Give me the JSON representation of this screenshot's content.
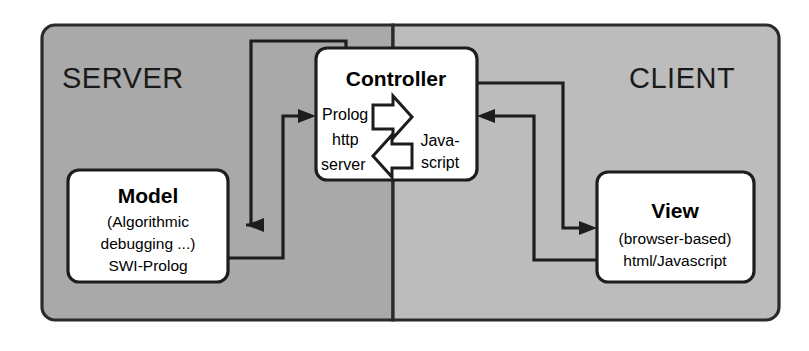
{
  "diagram": {
    "colors": {
      "server_panel": "#a9a9a9",
      "client_panel": "#bcbcbc",
      "panel_border": "#2b2b2b",
      "node_fill": "#ffffff",
      "node_border": "#1d1d1d",
      "connector": "#1d1d1d",
      "text": "#000000",
      "background": "#ffffff"
    },
    "zones": [
      {
        "id": "server",
        "label": "SERVER"
      },
      {
        "id": "client",
        "label": "CLIENT"
      }
    ],
    "nodes": [
      {
        "id": "model",
        "title": "Model",
        "lines": [
          "(Algorithmic",
          "debugging ...)",
          "SWI-Prolog"
        ]
      },
      {
        "id": "controller",
        "title": "Controller",
        "left_lines": [
          "Prolog",
          "http",
          "server"
        ],
        "right_lines": [
          "Java-",
          "script"
        ],
        "inner_arrows": [
          {
            "id": "exchange-arrow-right",
            "direction": "right"
          },
          {
            "id": "exchange-arrow-left",
            "direction": "left"
          }
        ]
      },
      {
        "id": "view",
        "title": "View",
        "lines": [
          "(browser-based)",
          "html/Javascript"
        ]
      }
    ],
    "connectors": [
      {
        "id": "controller-to-model",
        "from": "controller",
        "to": "model",
        "arrow": "left"
      },
      {
        "id": "model-to-controller",
        "from": "model",
        "to": "controller",
        "arrow": "right"
      },
      {
        "id": "controller-to-view",
        "from": "controller",
        "to": "view",
        "arrow": "right"
      },
      {
        "id": "view-to-controller",
        "from": "view",
        "to": "controller",
        "arrow": "left"
      }
    ]
  }
}
